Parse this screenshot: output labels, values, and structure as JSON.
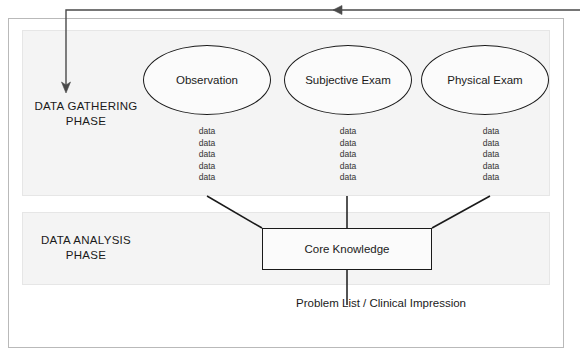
{
  "diagram": {
    "phases": [
      {
        "id": "gathering",
        "line1": "DATA GATHERING",
        "line2": "PHASE"
      },
      {
        "id": "analysis",
        "line1": "DATA ANALYSIS",
        "line2": "PHASE"
      }
    ],
    "nodes": [
      {
        "id": "observation",
        "label": "Observation",
        "shape": "ellipse"
      },
      {
        "id": "subjective-exam",
        "label": "Subjective Exam",
        "shape": "ellipse"
      },
      {
        "id": "physical-exam",
        "label": "Physical Exam",
        "shape": "ellipse"
      }
    ],
    "data_columns": [
      {
        "parent": "observation",
        "items": [
          "data",
          "data",
          "data",
          "data",
          "data"
        ]
      },
      {
        "parent": "subjective-exam",
        "items": [
          "data",
          "data",
          "data",
          "data",
          "data"
        ]
      },
      {
        "parent": "physical-exam",
        "items": [
          "data",
          "data",
          "data",
          "data",
          "data"
        ]
      }
    ],
    "core_box": {
      "id": "core-knowledge",
      "label": "Core Knowledge"
    },
    "output": {
      "id": "problem-list",
      "label": "Problem List / Clinical Impression"
    },
    "colors": {
      "stroke": "#1a1a1a",
      "panel_fill": "#f4f4f4",
      "panel_border": "#e6e6e6",
      "frame_border": "#b9b9b9",
      "feedback_arrow": "#4a4a4a",
      "page_background": "#ffffff"
    },
    "feedback_arrow": {
      "label": "feedback-loop-arrow",
      "direction": "right-to-left-then-down"
    }
  }
}
